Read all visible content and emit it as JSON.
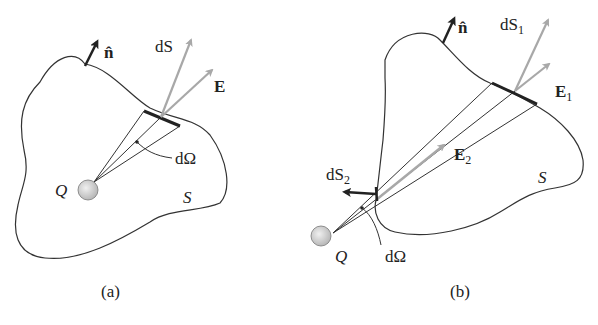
{
  "figure": {
    "panels": [
      {
        "id": "a",
        "caption": "(a)",
        "labels": {
          "normal": "n̂",
          "dS": "dS",
          "E": "E",
          "dOmega": "dΩ",
          "charge": "Q",
          "surface": "S"
        }
      },
      {
        "id": "b",
        "caption": "(b)",
        "labels": {
          "normal": "n̂",
          "dS1_base": "dS",
          "dS1_sub": "1",
          "E1_base": "E",
          "E1_sub": "1",
          "E2_base": "E",
          "E2_sub": "2",
          "dS2_base": "dS",
          "dS2_sub": "2",
          "dOmega": "dΩ",
          "charge": "Q",
          "surface": "S"
        }
      }
    ],
    "colors": {
      "outline": "#333333",
      "vector_gray": "#a8a8a8",
      "vector_dark": "#222222",
      "charge_fill": "#d0d0d0"
    }
  }
}
